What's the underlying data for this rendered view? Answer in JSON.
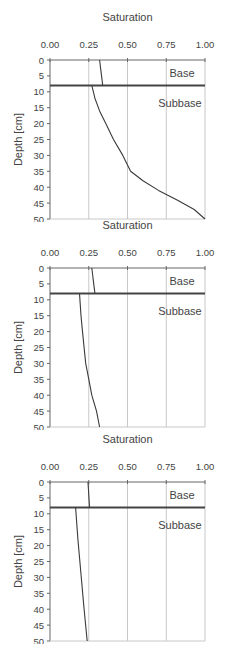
{
  "chart_data": [
    {
      "type": "line",
      "title": "Saturation",
      "xlabel": "Saturation",
      "ylabel": "Depth [cm]",
      "xlim": [
        0,
        1
      ],
      "ylim": [
        50,
        0
      ],
      "xticks": [
        "0.00",
        "0.25",
        "0.50",
        "0.75",
        "1.00"
      ],
      "yticks": [
        "0",
        "5",
        "10",
        "15",
        "20",
        "25",
        "30",
        "35",
        "40",
        "45",
        "50"
      ],
      "grid": "vertical",
      "layer_boundary_depth": 8,
      "annotations": [
        "Base",
        "Subbase"
      ],
      "series": [
        {
          "name": "Base",
          "x": [
            0.32,
            0.34
          ],
          "y": [
            0,
            8
          ]
        },
        {
          "name": "Subbase",
          "x": [
            0.27,
            0.29,
            0.32,
            0.36,
            0.41,
            0.47,
            0.52,
            0.6,
            0.7,
            0.82,
            0.93,
            1.0
          ],
          "y": [
            8,
            12,
            16,
            20,
            25,
            30,
            35,
            38,
            41,
            44,
            47,
            50
          ]
        }
      ]
    },
    {
      "type": "line",
      "title": "Saturation",
      "xlabel": "Saturation",
      "ylabel": "Depth [cm]",
      "xlim": [
        0,
        1
      ],
      "ylim": [
        50,
        0
      ],
      "xticks": [
        "0.00",
        "0.25",
        "0.50",
        "0.75",
        "1.00"
      ],
      "yticks": [
        "0",
        "5",
        "10",
        "15",
        "20",
        "25",
        "30",
        "35",
        "40",
        "45",
        "50"
      ],
      "grid": "vertical",
      "layer_boundary_depth": 8,
      "annotations": [
        "Base",
        "Subbase"
      ],
      "series": [
        {
          "name": "Base",
          "x": [
            0.27,
            0.29
          ],
          "y": [
            0,
            8
          ]
        },
        {
          "name": "Subbase",
          "x": [
            0.19,
            0.2,
            0.21,
            0.22,
            0.23,
            0.25,
            0.27,
            0.3,
            0.32
          ],
          "y": [
            8,
            15,
            20,
            25,
            30,
            35,
            40,
            45,
            50
          ]
        }
      ]
    },
    {
      "type": "line",
      "title": "Saturation",
      "xlabel": "Saturation",
      "ylabel": "Depth [cm]",
      "xlim": [
        0,
        1
      ],
      "ylim": [
        50,
        0
      ],
      "xticks": [
        "0.00",
        "0.25",
        "0.50",
        "0.75",
        "1.00"
      ],
      "yticks": [
        "0",
        "5",
        "10",
        "15",
        "20",
        "25",
        "30",
        "35",
        "40",
        "45",
        "50"
      ],
      "grid": "vertical",
      "layer_boundary_depth": 8,
      "annotations": [
        "Base",
        "Subbase"
      ],
      "series": [
        {
          "name": "Base",
          "x": [
            0.245,
            0.255
          ],
          "y": [
            0,
            8
          ]
        },
        {
          "name": "Subbase",
          "x": [
            0.165,
            0.18,
            0.2,
            0.22,
            0.24
          ],
          "y": [
            8,
            18,
            29,
            40,
            50
          ]
        }
      ]
    }
  ],
  "panels": [
    {
      "title": "Saturation",
      "ylabel": "Depth [cm]",
      "label_base": "Base",
      "label_subbase": "Subbase"
    },
    {
      "title": "Saturation",
      "ylabel": "Depth [cm]",
      "label_base": "Base",
      "label_subbase": "Subbase"
    },
    {
      "title": "Saturation",
      "ylabel": "Depth [cm]",
      "label_base": "Base",
      "label_subbase": "Subbase"
    }
  ],
  "colors": {
    "axis": "#666666",
    "grid": "#c8c8c8",
    "curve": "#3a3a3a",
    "boundary": "#444444",
    "text": "#444444"
  }
}
